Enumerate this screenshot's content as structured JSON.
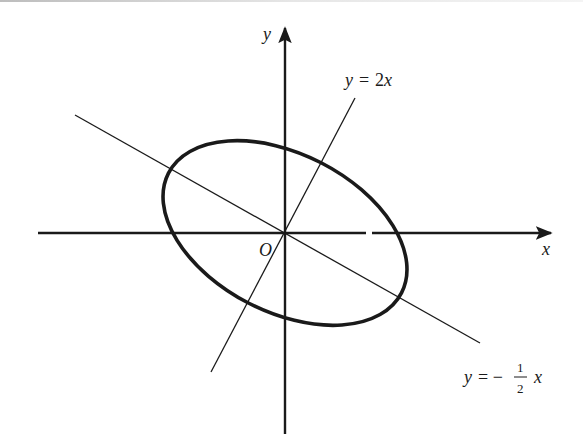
{
  "diagram": {
    "type": "coordinate-plane-ellipse",
    "colors": {
      "ink": "#1a1a1a",
      "background": "#ffffff"
    },
    "axes": {
      "x_label": "x",
      "y_label": "y",
      "origin_label": "O"
    },
    "lines": [
      {
        "id": "line-2x",
        "equation": "y = 2x",
        "label_lhs": "y",
        "label_eq": "=",
        "label_rhs": "2x"
      },
      {
        "id": "line-neg-half-x",
        "equation": "y = -1/2 x",
        "label_lhs": "y",
        "label_eq": "= −",
        "label_num": "1",
        "label_den": "2",
        "label_var": "x"
      }
    ],
    "ellipse": {
      "center": "O",
      "major_axis_direction": "y = -1/2 x",
      "minor_axis_direction": "y = 2x"
    }
  }
}
